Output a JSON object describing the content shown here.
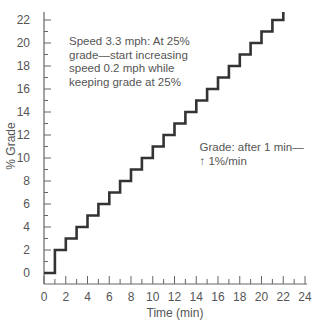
{
  "chart_data": {
    "type": "line",
    "style": "step",
    "title": "",
    "xlabel": "Time (min)",
    "ylabel": "% Grade",
    "xlim": [
      0,
      24
    ],
    "ylim": [
      0,
      22
    ],
    "x_ticks": [
      0,
      2,
      4,
      6,
      8,
      10,
      12,
      14,
      16,
      18,
      20,
      22,
      24
    ],
    "x_minor_ticks": [
      1,
      3,
      5,
      7,
      9,
      11,
      13,
      15,
      17,
      19,
      21,
      23
    ],
    "y_ticks": [
      0,
      2,
      4,
      6,
      8,
      10,
      12,
      14,
      16,
      18,
      20,
      22
    ],
    "y_minor_ticks": [
      1,
      3,
      5,
      7,
      9,
      11,
      13,
      15,
      17,
      19,
      21
    ],
    "grid": false,
    "legend": null,
    "series": [
      {
        "name": "Grade",
        "color": "#333333",
        "x": [
          0,
          1,
          1,
          2,
          2,
          3,
          3,
          4,
          4,
          5,
          5,
          6,
          6,
          7,
          7,
          8,
          8,
          9,
          9,
          10,
          10,
          11,
          11,
          12,
          12,
          13,
          13,
          14,
          14,
          15,
          15,
          16,
          16,
          17,
          17,
          18,
          18,
          19,
          19,
          20,
          20,
          21,
          21,
          22,
          22
        ],
        "y": [
          0,
          0,
          2,
          2,
          3,
          3,
          4,
          4,
          5,
          5,
          6,
          6,
          7,
          7,
          8,
          8,
          9,
          9,
          10,
          10,
          11,
          11,
          12,
          12,
          13,
          13,
          14,
          14,
          15,
          15,
          16,
          16,
          17,
          17,
          18,
          18,
          19,
          19,
          20,
          20,
          21,
          21,
          22,
          22,
          22.7
        ]
      }
    ],
    "annotations": [
      {
        "lines": [
          "Speed 3.3 mph: At 25%",
          "grade—start increasing",
          "speed 0.2 mph while",
          "keeping grade at 25%"
        ],
        "x": 2.3,
        "y": 19.8
      },
      {
        "lines": [
          "Grade: after 1 min—",
          "↑ 1%/min"
        ],
        "x": 14.3,
        "y": 10.6
      }
    ]
  }
}
